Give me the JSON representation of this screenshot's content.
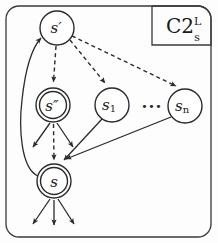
{
  "figure": {
    "title_label": {
      "base": "C2",
      "superscript": "L",
      "subscript": "s"
    },
    "ellipsis": "···",
    "nodes": [
      {
        "id": "s-prime",
        "label": "s",
        "prime": "′",
        "sub": "",
        "cx": 57,
        "cy": 28,
        "r": 17,
        "double": false
      },
      {
        "id": "s-double",
        "label": "s",
        "prime": "″",
        "sub": "",
        "cx": 53,
        "cy": 105,
        "r": 17,
        "double": true
      },
      {
        "id": "s-one",
        "label": "s",
        "prime": "",
        "sub": "1",
        "cx": 112,
        "cy": 105,
        "r": 17,
        "double": false
      },
      {
        "id": "s-n",
        "label": "s",
        "prime": "",
        "sub": "n",
        "cx": 185,
        "cy": 106,
        "r": 17,
        "double": false
      },
      {
        "id": "s",
        "label": "s",
        "prime": "",
        "sub": "",
        "cx": 54,
        "cy": 181,
        "r": 17,
        "double": true
      }
    ],
    "edges": [
      {
        "id": "edge-s-prime-to-s-double",
        "style": "dashed",
        "from": "s-prime",
        "to": "s-double"
      },
      {
        "id": "edge-s-prime-to-s-one",
        "style": "dashed",
        "from": "s-prime",
        "to": "s-one"
      },
      {
        "id": "edge-s-prime-to-s-n",
        "style": "dashed",
        "from": "s-prime",
        "to": "s-n"
      },
      {
        "id": "edge-s-double-to-s",
        "style": "dashed",
        "from": "s-double",
        "to": "s"
      },
      {
        "id": "edge-s-one-to-s",
        "style": "solid",
        "from": "s-one",
        "to": "s"
      },
      {
        "id": "edge-s-n-to-s",
        "style": "solid",
        "from": "s-n",
        "to": "s"
      },
      {
        "id": "edge-s-to-s-prime",
        "style": "solid",
        "from": "s",
        "to": "s-prime"
      },
      {
        "id": "edge-s-double-out-left",
        "style": "solid",
        "from": "s-double",
        "to": "open"
      },
      {
        "id": "edge-s-double-out-right",
        "style": "solid",
        "from": "s-double",
        "to": "open"
      },
      {
        "id": "edge-s-out-left",
        "style": "solid",
        "from": "s",
        "to": "open"
      },
      {
        "id": "edge-s-out-middle",
        "style": "solid",
        "from": "s",
        "to": "open"
      },
      {
        "id": "edge-s-out-right",
        "style": "solid",
        "from": "s",
        "to": "open"
      }
    ],
    "colors": {
      "ink": "#2b2b2b",
      "background": "#fdfdfd",
      "frame": "#3a3a3a"
    }
  }
}
